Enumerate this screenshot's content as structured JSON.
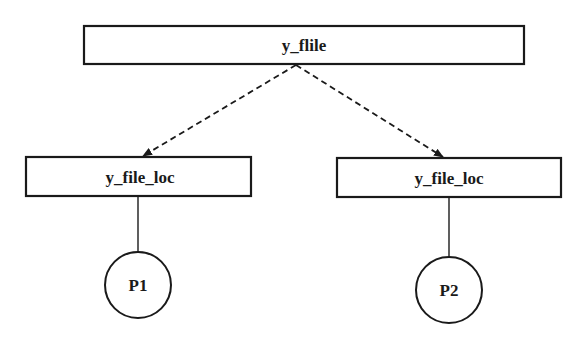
{
  "diagram": {
    "colors": {
      "stroke": "#1a1a1a",
      "background": "#ffffff"
    },
    "root": {
      "label": "y_flile"
    },
    "children": [
      {
        "label": "y_file_loc",
        "process": "P1"
      },
      {
        "label": "y_file_loc",
        "process": "P2"
      }
    ],
    "edges": [
      {
        "from": "y_flile",
        "to": "y_file_loc (left)",
        "style": "dashed-arrow"
      },
      {
        "from": "y_flile",
        "to": "y_file_loc (right)",
        "style": "dashed-arrow"
      },
      {
        "from": "y_file_loc (left)",
        "to": "P1",
        "style": "solid"
      },
      {
        "from": "y_file_loc (right)",
        "to": "P2",
        "style": "solid"
      }
    ]
  }
}
